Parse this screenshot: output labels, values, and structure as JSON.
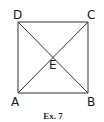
{
  "figure": {
    "caption": "Ex. 7",
    "shape": "square with diagonals",
    "points": {
      "A": {
        "label": "A"
      },
      "B": {
        "label": "B"
      },
      "C": {
        "label": "C"
      },
      "D": {
        "label": "D"
      },
      "E": {
        "label": "E"
      }
    },
    "segments": [
      "AB",
      "BC",
      "CD",
      "DA",
      "AC",
      "BD"
    ],
    "intersection": "E",
    "stroke_color": "#333333"
  }
}
